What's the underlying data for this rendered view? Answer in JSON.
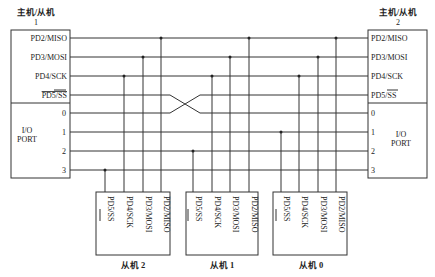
{
  "master1": {
    "title": "主机/从机",
    "number": "1",
    "spi_pins": [
      "PD2/MISO",
      "PD3/MOSI",
      "PD4/SCK",
      "PD5/SS"
    ],
    "io_label_line1": "I/O",
    "io_label_line2": "PORT",
    "io_pins": [
      "0",
      "1",
      "2",
      "3"
    ]
  },
  "master2": {
    "title": "主机/从机",
    "number": "2",
    "spi_pins": [
      "PD2/MISO",
      "PD3/MOSI",
      "PD4/SCK",
      "PD5/SS"
    ],
    "io_label_line1": "I/O",
    "io_label_line2": "PORT",
    "io_pins": [
      "0",
      "1",
      "2",
      "3"
    ]
  },
  "slaves": [
    {
      "label": "从机 2",
      "pins": [
        "PD5/SS",
        "PD4/SCK",
        "PD3/MOSI",
        "PD2/MISO"
      ],
      "ss_io_line": "3"
    },
    {
      "label": "从机 1",
      "pins": [
        "PD5/SS",
        "PD4/SCK",
        "PD3/MOSI",
        "PD2/MISO"
      ],
      "ss_io_line": "2"
    },
    {
      "label": "从机 0",
      "pins": [
        "PD5/SS",
        "PD4/SCK",
        "PD3/MOSI",
        "PD2/MISO"
      ],
      "ss_io_line": "1"
    }
  ],
  "note_crossover": "PD5/SS of master 1 crosses to line 0 of master 2 and vice versa"
}
